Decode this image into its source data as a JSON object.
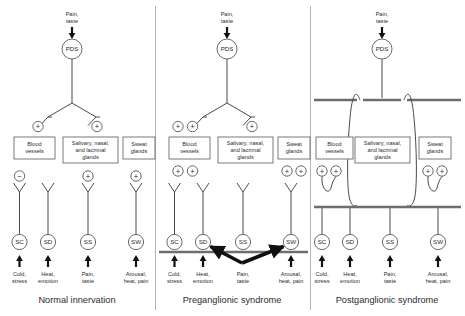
{
  "figure": {
    "panel_count": 3
  },
  "labels": {
    "input_top": "Pain,\ntaste",
    "input_top_line1": "Pain,",
    "input_top_line2": "taste",
    "pds": "PDS",
    "blood_vessels_l1": "Blood",
    "blood_vessels_l2": "vessels",
    "glands_l1": "Salivary, nasal,",
    "glands_l2": "and lacrimal",
    "glands_l3": "glands",
    "sweat_l1": "Sweat",
    "sweat_l2": "glands",
    "sc": "SC",
    "sd": "SD",
    "ss": "SS",
    "sw": "SW",
    "sc_in_l1": "Cold,",
    "sc_in_l2": "stress",
    "sd_in_l1": "Heat,",
    "sd_in_l2": "emotion",
    "ss_in_l1": "Pain,",
    "ss_in_l2": "taste",
    "sw_in_l1": "Arousal,",
    "sw_in_l2": "heat, pain",
    "plus": "+",
    "minus": "−"
  },
  "panels": [
    {
      "id": "normal",
      "caption": "Normal innervation",
      "pds_label": "PDS",
      "effectors": [
        {
          "name": "blood-vessels",
          "lines": [
            "Blood",
            "vessels"
          ],
          "signs_above": [
            "+"
          ],
          "signs_below": []
        },
        {
          "name": "salivary-nasal-lacrimal-glands",
          "lines": [
            "Salivary, nasal,",
            "and lacrimal",
            "glands"
          ],
          "signs_above": [
            "+"
          ],
          "signs_below": []
        },
        {
          "name": "sweat-glands",
          "lines": [
            "Sweat",
            "glands"
          ],
          "signs_above": [
            "+"
          ],
          "signs_below": []
        }
      ],
      "sympathetic_neurons": [
        {
          "code": "SC",
          "sign": "−",
          "stimulus": [
            "Cold,",
            "stress"
          ]
        },
        {
          "code": "SD",
          "sign": "",
          "stimulus": [
            "Heat,",
            "emotion"
          ]
        },
        {
          "code": "SS",
          "sign": "+",
          "stimulus": [
            "Pain,",
            "taste"
          ]
        },
        {
          "code": "SW",
          "sign": "+",
          "stimulus": [
            "Arousal,",
            "heat, pain"
          ]
        }
      ],
      "has_lesion_bar": false,
      "has_thick_arrows": false,
      "has_loops": false
    },
    {
      "id": "preganglionic",
      "caption": "Preganglionic syndrome",
      "pds_label": "PDS",
      "effectors": [
        {
          "name": "blood-vessels",
          "lines": [
            "Blood",
            "vessels"
          ],
          "signs_above": [
            "+",
            "+"
          ],
          "signs_below": [
            "+",
            "+"
          ]
        },
        {
          "name": "salivary-nasal-lacrimal-glands",
          "lines": [
            "Salivary, nasal,",
            "and lacrimal",
            "glands"
          ],
          "signs_above": [
            "+"
          ],
          "signs_below": []
        },
        {
          "name": "sweat-glands",
          "lines": [
            "Sweat",
            "glands"
          ],
          "signs_above": [],
          "signs_below": [
            "+",
            "+"
          ]
        }
      ],
      "sympathetic_neurons": [
        {
          "code": "SC",
          "sign": "",
          "stimulus": [
            "Cold,",
            "stress"
          ]
        },
        {
          "code": "SD",
          "sign": "",
          "stimulus": [
            "Heat,",
            "emotion"
          ]
        },
        {
          "code": "SS",
          "sign": "",
          "stimulus": [
            "Pain,",
            "taste"
          ]
        },
        {
          "code": "SW",
          "sign": "",
          "stimulus": [
            "Arousal,",
            "heat, pain"
          ]
        }
      ],
      "has_lesion_bar": true,
      "has_thick_arrows": true,
      "thick_arrow_targets": [
        "SD",
        "SW"
      ],
      "thick_arrow_source": "Pain, taste",
      "has_loops": false
    },
    {
      "id": "postganglionic",
      "caption": "Postganglionic syndrome",
      "pds_label": "PDS",
      "effectors": [
        {
          "name": "blood-vessels",
          "lines": [
            "Blood",
            "vessels"
          ],
          "signs_above": [],
          "signs_below": [
            "+",
            "+"
          ]
        },
        {
          "name": "salivary-nasal-lacrimal-glands",
          "lines": [
            "Salivary, nasal,",
            "and lacrimal",
            "glands"
          ],
          "signs_above": [],
          "signs_below": []
        },
        {
          "name": "sweat-glands",
          "lines": [
            "Sweat",
            "glands"
          ],
          "signs_above": [],
          "signs_below": [
            "+",
            "+"
          ]
        }
      ],
      "sympathetic_neurons": [
        {
          "code": "SC",
          "sign": "",
          "stimulus": [
            "Cold,",
            "stress"
          ]
        },
        {
          "code": "SD",
          "sign": "",
          "stimulus": [
            "Heat,",
            "emotion"
          ]
        },
        {
          "code": "SS",
          "sign": "",
          "stimulus": [
            "Pain,",
            "taste"
          ]
        },
        {
          "code": "SW",
          "sign": "",
          "stimulus": [
            "Arousal,",
            "heat, pain"
          ]
        }
      ],
      "has_lesion_bar": true,
      "lesion_bar_count": 2,
      "has_thick_arrows": false,
      "has_loops": true,
      "loop_count": 3
    }
  ],
  "colors": {
    "stroke": "#4a4a4a",
    "text": "#2b2b2b",
    "bar": "#6d6d6d",
    "divider": "#b5b5b5",
    "arrow": "#101010",
    "background": "#ffffff"
  }
}
